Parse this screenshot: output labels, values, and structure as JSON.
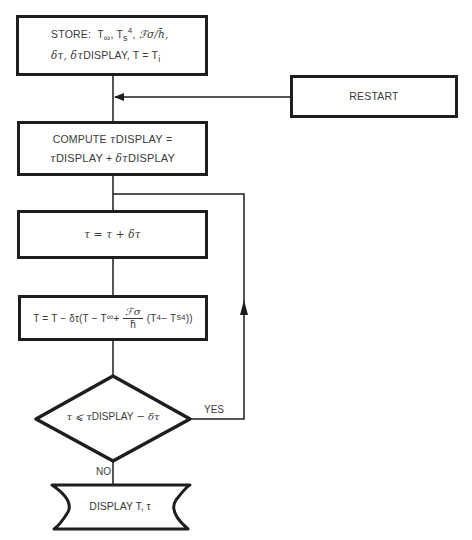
{
  "flowchart": {
    "store": {
      "line1": "STORE:  T∞, Ts⁴, ℱσ/h̄,",
      "line2": "δτ, δτDISPLAY, T = Ti",
      "prefix": "STORE:",
      "t_inf": "T",
      "t_inf_sub": "∞",
      "ts": "T",
      "ts_sub": "s",
      "ts_sup": "4",
      "fsigma": "ℱσ/h̄,",
      "dtau": "δτ, δτ",
      "display": "DISPLAY, T = T",
      "ti_sub": "i"
    },
    "restart": {
      "label": "RESTART"
    },
    "compute": {
      "line1_prefix": "COMPUTE ",
      "tau": "τ",
      "display": "DISPLAY",
      "eq": " =",
      "plus": " + ",
      "dtau": "δτ"
    },
    "increment": {
      "label": "τ = τ + δτ"
    },
    "update": {
      "left": "T = T − δτ(T − T",
      "inf_sub": "∞",
      "plus": " +",
      "frac_num": "ℱσ",
      "frac_den": "h̄",
      "right_a": "(T",
      "sup4": "4",
      "right_b": " − T",
      "s_sub": "s",
      "close": "))"
    },
    "decision": {
      "tau": "τ ⩽ τ",
      "display": "DISPLAY",
      "rest": " − δτ",
      "yes_label": "YES",
      "no_label": "NO"
    },
    "output": {
      "label": "DISPLAY T, τ"
    }
  },
  "colors": {
    "line": "#1e1e1e",
    "text": "#3a3a3a",
    "background": "#ffffff"
  }
}
